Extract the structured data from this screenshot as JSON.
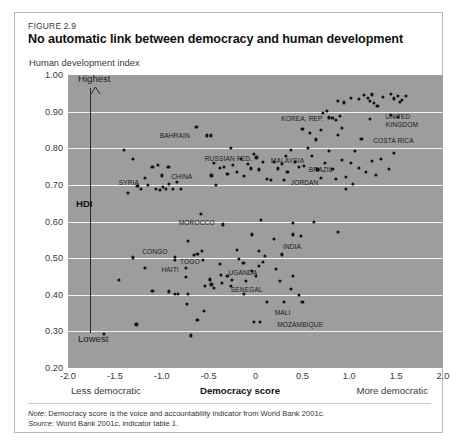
{
  "figure": {
    "label": "FIGURE 2.9",
    "title": "No automatic link between democracy and human development",
    "y_axis_caption": "Human development index"
  },
  "annotations": {
    "highest": "Highest",
    "lowest": "Lowest",
    "hdi": "HDI",
    "x_left": "Less democratic",
    "x_center": "Democracy score",
    "x_right": "More democratic"
  },
  "notes": {
    "note_key": "Note:",
    "note_text": " Democracy score is the voice and accountability indicator from World Bank 2001c.",
    "source_key": "Source:",
    "source_text": " World Bank 2001c, indicator table 1."
  },
  "colors": {
    "plot_background": "#9d9d9d",
    "gridline": "#f2f2f2",
    "point": "#111111",
    "card_border": "#b9b9b9"
  },
  "chart_data": {
    "type": "scatter",
    "title": "No automatic link between democracy and human development",
    "xlabel": "Democracy score",
    "ylabel": "Human development index",
    "xlim": [
      -2.0,
      2.0
    ],
    "ylim": [
      0.2,
      1.0
    ],
    "xticks": [
      -2.0,
      -1.5,
      -1.0,
      -0.5,
      0,
      0.5,
      1.0,
      1.5,
      2.0
    ],
    "xtick_labels": [
      "-2.0",
      "-1.5",
      "-1.0",
      "-0.5",
      "0",
      "0.5",
      "1.0",
      "1.5",
      "2.0"
    ],
    "yticks": [
      0.2,
      0.3,
      0.4,
      0.5,
      0.6,
      0.7,
      0.8,
      0.9,
      1.0
    ],
    "ytick_labels": [
      "0.20",
      "0.30",
      "0.40",
      "0.50",
      "0.60",
      "0.70",
      "0.80",
      "0.90",
      "1.00"
    ],
    "grid": "horizontal",
    "legend": "none",
    "marker_color": "#111111",
    "labeled_points": [
      {
        "name": "BAHRAIN",
        "x": -0.52,
        "y": 0.835,
        "label_dx": -32,
        "label_dy": 0
      },
      {
        "name": "SYRIA",
        "x": -1.18,
        "y": 0.718,
        "label_dx": -16,
        "label_dy": 4
      },
      {
        "name": "CHINA",
        "x": -1.0,
        "y": 0.726,
        "label_dx": 20,
        "label_dy": 1
      },
      {
        "name": "RUSSIAN FED.",
        "x": 0.01,
        "y": 0.775,
        "label_dx": -28,
        "label_dy": 1
      },
      {
        "name": "MALAYSIA",
        "x": 0.32,
        "y": 0.778,
        "label_dx": 2,
        "label_dy": 4
      },
      {
        "name": "BRAZIL",
        "x": 0.46,
        "y": 0.748,
        "label_dx": 22,
        "label_dy": 2
      },
      {
        "name": "JORDAN",
        "x": 0.3,
        "y": 0.714,
        "label_dx": 21,
        "label_dy": 2
      },
      {
        "name": "KOREA, REP.",
        "x": 0.82,
        "y": 0.883,
        "label_dx": -30,
        "label_dy": 0
      },
      {
        "name": "UNITED",
        "x": 1.54,
        "y": 0.927,
        "label_dx": -2,
        "label_dy": 14
      },
      {
        "name": "KINGDOM",
        "x": 1.54,
        "y": 0.927,
        "label_dx": 2,
        "label_dy": 22
      },
      {
        "name": "COSTA RICA",
        "x": 1.13,
        "y": 0.826,
        "label_dx": 32,
        "label_dy": 1
      },
      {
        "name": "MOROCCO",
        "x": -0.35,
        "y": 0.592,
        "label_dx": -26,
        "label_dy": -2
      },
      {
        "name": "INDIA",
        "x": 0.4,
        "y": 0.565,
        "label_dx": -1,
        "label_dy": 12
      },
      {
        "name": "CONGO",
        "x": -0.86,
        "y": 0.503,
        "label_dx": -20,
        "label_dy": -6
      },
      {
        "name": "TOGO",
        "x": -0.86,
        "y": 0.496,
        "label_dx": 15,
        "label_dy": 1
      },
      {
        "name": "HAITI",
        "x": -0.74,
        "y": 0.473,
        "label_dx": -16,
        "label_dy": 1
      },
      {
        "name": "UGANDA",
        "x": -0.37,
        "y": 0.455,
        "label_dx": 22,
        "label_dy": -3
      },
      {
        "name": "SENEGAL",
        "x": -0.36,
        "y": 0.432,
        "label_dx": 25,
        "label_dy": 6
      },
      {
        "name": "MALI",
        "x": 0.3,
        "y": 0.381,
        "label_dx": -1,
        "label_dy": 10
      },
      {
        "name": "MOZAMBIQUE",
        "x": 0.05,
        "y": 0.325,
        "label_dx": 40,
        "label_dy": 2
      }
    ],
    "points": [
      {
        "x": -1.62,
        "y": 0.292
      },
      {
        "x": -1.46,
        "y": 0.44
      },
      {
        "x": -1.31,
        "y": 0.502
      },
      {
        "x": -1.27,
        "y": 0.319
      },
      {
        "x": -1.18,
        "y": 0.474
      },
      {
        "x": -1.1,
        "y": 0.41
      },
      {
        "x": -1.4,
        "y": 0.796
      },
      {
        "x": -1.31,
        "y": 0.77
      },
      {
        "x": -1.36,
        "y": 0.677
      },
      {
        "x": -1.26,
        "y": 0.698
      },
      {
        "x": -1.22,
        "y": 0.69
      },
      {
        "x": -1.15,
        "y": 0.701
      },
      {
        "x": -1.1,
        "y": 0.75
      },
      {
        "x": -1.06,
        "y": 0.688
      },
      {
        "x": -1.04,
        "y": 0.755
      },
      {
        "x": -1.02,
        "y": 0.687
      },
      {
        "x": -0.99,
        "y": 0.694
      },
      {
        "x": -0.96,
        "y": 0.69
      },
      {
        "x": -0.93,
        "y": 0.749
      },
      {
        "x": -0.92,
        "y": 0.702
      },
      {
        "x": -0.88,
        "y": 0.689
      },
      {
        "x": -0.84,
        "y": 0.707
      },
      {
        "x": -0.8,
        "y": 0.69
      },
      {
        "x": -0.92,
        "y": 0.409
      },
      {
        "x": -0.86,
        "y": 0.403
      },
      {
        "x": -0.83,
        "y": 0.402
      },
      {
        "x": -0.74,
        "y": 0.448
      },
      {
        "x": -0.72,
        "y": 0.403
      },
      {
        "x": -0.73,
        "y": 0.374
      },
      {
        "x": -0.69,
        "y": 0.289
      },
      {
        "x": -0.66,
        "y": 0.508
      },
      {
        "x": -0.72,
        "y": 0.547
      },
      {
        "x": -0.62,
        "y": 0.512
      },
      {
        "x": -0.58,
        "y": 0.62
      },
      {
        "x": -0.63,
        "y": 0.858
      },
      {
        "x": -0.48,
        "y": 0.835
      },
      {
        "x": -0.44,
        "y": 0.76
      },
      {
        "x": -0.47,
        "y": 0.726
      },
      {
        "x": -0.42,
        "y": 0.7
      },
      {
        "x": -0.38,
        "y": 0.746
      },
      {
        "x": -0.34,
        "y": 0.749
      },
      {
        "x": -0.3,
        "y": 0.729
      },
      {
        "x": -0.26,
        "y": 0.802
      },
      {
        "x": -0.24,
        "y": 0.755
      },
      {
        "x": -0.2,
        "y": 0.735
      },
      {
        "x": -0.16,
        "y": 0.77
      },
      {
        "x": -0.12,
        "y": 0.724
      },
      {
        "x": -0.08,
        "y": 0.757
      },
      {
        "x": -0.05,
        "y": 0.745
      },
      {
        "x": -0.02,
        "y": 0.784
      },
      {
        "x": 0.04,
        "y": 0.742
      },
      {
        "x": 0.08,
        "y": 0.762
      },
      {
        "x": 0.12,
        "y": 0.716
      },
      {
        "x": 0.16,
        "y": 0.714
      },
      {
        "x": 0.2,
        "y": 0.762
      },
      {
        "x": 0.24,
        "y": 0.745
      },
      {
        "x": 0.28,
        "y": 0.758
      },
      {
        "x": 0.34,
        "y": 0.735
      },
      {
        "x": 0.38,
        "y": 0.796
      },
      {
        "x": 0.42,
        "y": 0.763
      },
      {
        "x": 0.52,
        "y": 0.752
      },
      {
        "x": 0.56,
        "y": 0.8
      },
      {
        "x": 0.6,
        "y": 0.78
      },
      {
        "x": 0.66,
        "y": 0.742
      },
      {
        "x": 0.7,
        "y": 0.718
      },
      {
        "x": 0.74,
        "y": 0.76
      },
      {
        "x": 0.78,
        "y": 0.792
      },
      {
        "x": 0.82,
        "y": 0.744
      },
      {
        "x": 0.86,
        "y": 0.716
      },
      {
        "x": 0.92,
        "y": 0.768
      },
      {
        "x": 0.96,
        "y": 0.722
      },
      {
        "x": 1.02,
        "y": 0.76
      },
      {
        "x": 1.06,
        "y": 0.792
      },
      {
        "x": 1.1,
        "y": 0.746
      },
      {
        "x": 1.04,
        "y": 0.702
      },
      {
        "x": 0.96,
        "y": 0.688
      },
      {
        "x": 1.18,
        "y": 0.735
      },
      {
        "x": 1.24,
        "y": 0.766
      },
      {
        "x": 1.28,
        "y": 0.728
      },
      {
        "x": 1.34,
        "y": 0.772
      },
      {
        "x": 1.42,
        "y": 0.744
      },
      {
        "x": 1.48,
        "y": 0.788
      },
      {
        "x": 0.5,
        "y": 0.852
      },
      {
        "x": 0.58,
        "y": 0.842
      },
      {
        "x": 0.64,
        "y": 0.824
      },
      {
        "x": 0.7,
        "y": 0.849
      },
      {
        "x": 0.88,
        "y": 0.836
      },
      {
        "x": 0.92,
        "y": 0.855
      },
      {
        "x": 0.72,
        "y": 0.896
      },
      {
        "x": 0.76,
        "y": 0.901
      },
      {
        "x": 0.78,
        "y": 0.884
      },
      {
        "x": 0.88,
        "y": 0.929
      },
      {
        "x": 0.94,
        "y": 0.925
      },
      {
        "x": 1.02,
        "y": 0.938
      },
      {
        "x": 1.1,
        "y": 0.935
      },
      {
        "x": 1.16,
        "y": 0.945
      },
      {
        "x": 1.2,
        "y": 0.938
      },
      {
        "x": 1.22,
        "y": 0.93
      },
      {
        "x": 1.24,
        "y": 0.947
      },
      {
        "x": 1.26,
        "y": 0.924
      },
      {
        "x": 1.3,
        "y": 0.916
      },
      {
        "x": 1.36,
        "y": 0.941
      },
      {
        "x": 1.44,
        "y": 0.948
      },
      {
        "x": 1.48,
        "y": 0.936
      },
      {
        "x": 1.52,
        "y": 0.944
      },
      {
        "x": 1.56,
        "y": 0.932
      },
      {
        "x": 1.6,
        "y": 0.944
      },
      {
        "x": 1.44,
        "y": 0.89
      },
      {
        "x": 1.52,
        "y": 0.886
      },
      {
        "x": 1.22,
        "y": 0.88
      },
      {
        "x": 0.86,
        "y": 0.878
      },
      {
        "x": 0.9,
        "y": 0.888
      },
      {
        "x": 0.4,
        "y": 0.596
      },
      {
        "x": 0.2,
        "y": 0.552
      },
      {
        "x": 0.06,
        "y": 0.604
      },
      {
        "x": -0.04,
        "y": 0.565
      },
      {
        "x": 0.62,
        "y": 0.598
      },
      {
        "x": 0.88,
        "y": 0.572
      },
      {
        "x": 0.48,
        "y": 0.561
      },
      {
        "x": -0.18,
        "y": 0.498
      },
      {
        "x": -0.3,
        "y": 0.452
      },
      {
        "x": -0.25,
        "y": 0.441
      },
      {
        "x": -0.26,
        "y": 0.424
      },
      {
        "x": -0.49,
        "y": 0.442
      },
      {
        "x": -0.47,
        "y": 0.428
      },
      {
        "x": -0.44,
        "y": 0.419
      },
      {
        "x": -0.54,
        "y": 0.425
      },
      {
        "x": -0.13,
        "y": 0.487
      },
      {
        "x": -0.1,
        "y": 0.437
      },
      {
        "x": -0.04,
        "y": 0.464
      },
      {
        "x": 0.0,
        "y": 0.452
      },
      {
        "x": 0.04,
        "y": 0.478
      },
      {
        "x": 0.08,
        "y": 0.49
      },
      {
        "x": 0.1,
        "y": 0.505
      },
      {
        "x": -0.2,
        "y": 0.522
      },
      {
        "x": 0.04,
        "y": 0.52
      },
      {
        "x": 0.28,
        "y": 0.51
      },
      {
        "x": 0.26,
        "y": 0.438
      },
      {
        "x": -0.55,
        "y": 0.356
      },
      {
        "x": -0.62,
        "y": 0.332
      },
      {
        "x": -0.02,
        "y": 0.325
      },
      {
        "x": 0.12,
        "y": 0.38
      },
      {
        "x": 0.38,
        "y": 0.416
      },
      {
        "x": 0.46,
        "y": 0.4
      },
      {
        "x": 0.4,
        "y": 0.452
      },
      {
        "x": 0.22,
        "y": 0.47
      },
      {
        "x": -0.12,
        "y": 0.403
      },
      {
        "x": 0.5,
        "y": 0.38
      },
      {
        "x": -0.38,
        "y": 0.485
      },
      {
        "x": -0.56,
        "y": 0.496
      },
      {
        "x": -0.57,
        "y": 0.52
      }
    ]
  }
}
